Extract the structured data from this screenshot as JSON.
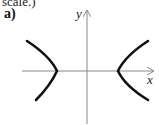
{
  "header": {
    "cutoff_text": "scale.)"
  },
  "figure": {
    "part_label": "a)",
    "x_axis_label": "x",
    "y_axis_label": "y",
    "curve_type": "hyperbola (horizontal transverse axis)"
  },
  "colors": {
    "axis": "#888888",
    "curve": "#111111"
  }
}
